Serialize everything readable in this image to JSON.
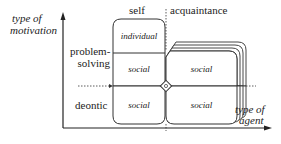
{
  "axes": {
    "y_label_line1": "type of",
    "y_label_line2": "motivation",
    "x_label_line1": "type of",
    "x_label_line2": "agent"
  },
  "columns": {
    "self": "self",
    "acquaintance": "acquaintance"
  },
  "rows": {
    "problem_solving_line1": "problem-",
    "problem_solving_line2": "solving",
    "deontic": "deontic"
  },
  "cells": {
    "self_individual": "individual",
    "self_social_problem": "social",
    "acq_social_problem": "social",
    "self_social_deontic": "social",
    "acq_social_deontic": "social"
  }
}
